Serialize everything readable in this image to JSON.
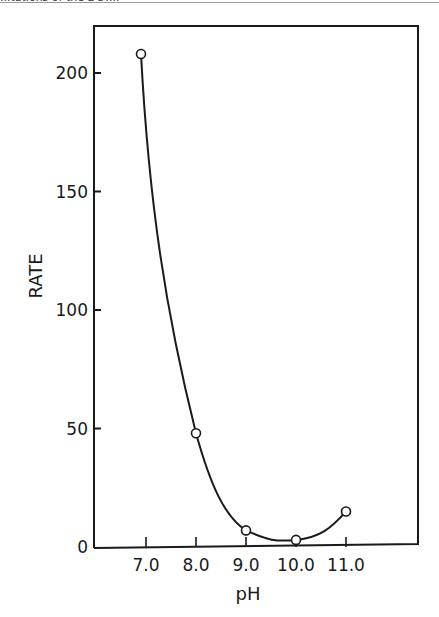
{
  "header": {
    "cut_text": "...tations of the DCT..."
  },
  "chart_data": {
    "type": "line",
    "title": "",
    "xlabel": "pH",
    "ylabel": "RATE",
    "x_ticks": [
      "7.0",
      "8.0",
      "9.0",
      "10.0",
      "11.0"
    ],
    "y_ticks": [
      "0",
      "50",
      "100",
      "150",
      "200"
    ],
    "ylim": [
      0,
      220
    ],
    "xlim": [
      6.0,
      12.5
    ],
    "grid": false,
    "legend": null,
    "series": [
      {
        "name": "Rate vs pH",
        "marker": "open-circle",
        "smooth": true,
        "x": [
          6.9,
          8.0,
          9.0,
          10.0,
          11.0
        ],
        "y": [
          208,
          48,
          7,
          3,
          15
        ]
      }
    ]
  }
}
